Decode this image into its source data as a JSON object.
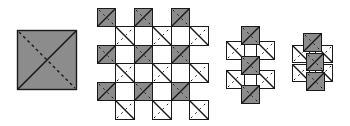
{
  "diagram": {
    "title": "",
    "colors": {
      "background": "#ffffff",
      "gray_fill": "#8c8c8c",
      "white_fill": "#ffffff",
      "stroke": "#1a1a1a"
    },
    "figures": [
      {
        "name": "single-large-tile",
        "tiles": [
          {
            "x": 17,
            "y": 30,
            "size": 59,
            "fill": "gray"
          }
        ]
      },
      {
        "name": "checker-grid",
        "tiles": [
          {
            "x": 97,
            "y": 8,
            "size": 18,
            "fill": "gray"
          },
          {
            "x": 134,
            "y": 8,
            "size": 18,
            "fill": "gray"
          },
          {
            "x": 171,
            "y": 8,
            "size": 18,
            "fill": "gray"
          },
          {
            "x": 115,
            "y": 26,
            "size": 19,
            "fill": "white"
          },
          {
            "x": 152,
            "y": 26,
            "size": 19,
            "fill": "white"
          },
          {
            "x": 189,
            "y": 26,
            "size": 19,
            "fill": "white"
          },
          {
            "x": 97,
            "y": 45,
            "size": 18,
            "fill": "gray"
          },
          {
            "x": 134,
            "y": 45,
            "size": 18,
            "fill": "gray"
          },
          {
            "x": 171,
            "y": 45,
            "size": 18,
            "fill": "gray"
          },
          {
            "x": 115,
            "y": 63,
            "size": 19,
            "fill": "white"
          },
          {
            "x": 152,
            "y": 63,
            "size": 19,
            "fill": "white"
          },
          {
            "x": 189,
            "y": 63,
            "size": 19,
            "fill": "white"
          },
          {
            "x": 97,
            "y": 82,
            "size": 18,
            "fill": "gray"
          },
          {
            "x": 134,
            "y": 82,
            "size": 18,
            "fill": "gray"
          },
          {
            "x": 171,
            "y": 82,
            "size": 18,
            "fill": "gray"
          },
          {
            "x": 115,
            "y": 100,
            "size": 19,
            "fill": "white"
          },
          {
            "x": 152,
            "y": 100,
            "size": 19,
            "fill": "white"
          },
          {
            "x": 189,
            "y": 100,
            "size": 19,
            "fill": "white"
          }
        ]
      },
      {
        "name": "column-cluster-medium",
        "tiles": [
          {
            "x": 226,
            "y": 41,
            "size": 18,
            "fill": "white"
          },
          {
            "x": 256,
            "y": 41,
            "size": 18,
            "fill": "white"
          },
          {
            "x": 226,
            "y": 70,
            "size": 18,
            "fill": "white"
          },
          {
            "x": 256,
            "y": 70,
            "size": 18,
            "fill": "white"
          },
          {
            "x": 241,
            "y": 26,
            "size": 18,
            "fill": "gray"
          },
          {
            "x": 241,
            "y": 56,
            "size": 18,
            "fill": "gray"
          },
          {
            "x": 241,
            "y": 85,
            "size": 18,
            "fill": "gray"
          }
        ]
      },
      {
        "name": "column-cluster-compact",
        "tiles": [
          {
            "x": 292,
            "y": 45,
            "size": 17,
            "fill": "white"
          },
          {
            "x": 315,
            "y": 45,
            "size": 17,
            "fill": "white"
          },
          {
            "x": 292,
            "y": 64,
            "size": 17,
            "fill": "white"
          },
          {
            "x": 315,
            "y": 64,
            "size": 17,
            "fill": "white"
          },
          {
            "x": 303,
            "y": 33,
            "size": 18,
            "fill": "gray"
          },
          {
            "x": 306,
            "y": 53,
            "size": 17,
            "fill": "gray"
          },
          {
            "x": 306,
            "y": 72,
            "size": 18,
            "fill": "gray"
          }
        ]
      }
    ]
  }
}
